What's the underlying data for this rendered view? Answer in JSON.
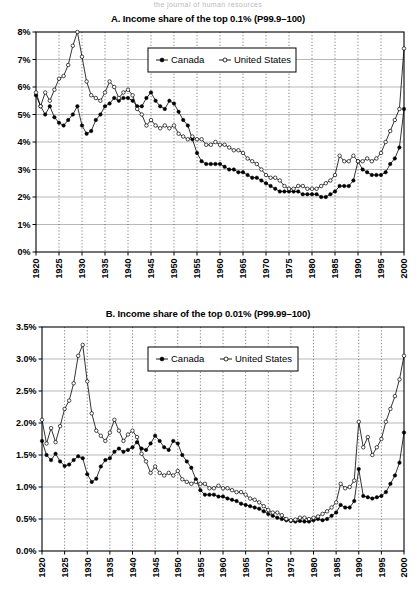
{
  "page": {
    "header_artifact": "the journal of human resources"
  },
  "legend": {
    "series": [
      {
        "name": "Canada",
        "marker": "filled-circle",
        "color": "#000000"
      },
      {
        "name": "United States",
        "marker": "open-circle",
        "color": "#000000"
      }
    ]
  },
  "chart_data": [
    {
      "type": "line",
      "id": "panel-a",
      "title": "A. Income share of the top 0.1% (P99.9–100)",
      "xlabel": "",
      "ylabel": "",
      "xlim": [
        1920,
        2000
      ],
      "ylim": [
        0,
        8
      ],
      "grid": true,
      "legend_position": "upper-center",
      "xticks": [
        1920,
        1925,
        1930,
        1935,
        1940,
        1945,
        1950,
        1955,
        1960,
        1965,
        1970,
        1975,
        1980,
        1985,
        1990,
        1995,
        2000
      ],
      "xticklabels": [
        "1920",
        "1925",
        "1930",
        "1935",
        "1940",
        "1945",
        "1950",
        "1955",
        "1960",
        "1965",
        "1970",
        "1975",
        "1980",
        "1985",
        "1990",
        "1995",
        "2000"
      ],
      "yticks": [
        0,
        1,
        2,
        3,
        4,
        5,
        6,
        7,
        8
      ],
      "yticklabels": [
        "0%",
        "1%",
        "2%",
        "3%",
        "4%",
        "5%",
        "6%",
        "7%",
        "8%"
      ],
      "x": [
        1920,
        1921,
        1922,
        1923,
        1924,
        1925,
        1926,
        1927,
        1928,
        1929,
        1930,
        1931,
        1932,
        1933,
        1934,
        1935,
        1936,
        1937,
        1938,
        1939,
        1940,
        1941,
        1942,
        1943,
        1944,
        1945,
        1946,
        1947,
        1948,
        1949,
        1950,
        1951,
        1952,
        1953,
        1954,
        1955,
        1956,
        1957,
        1958,
        1959,
        1960,
        1961,
        1962,
        1963,
        1964,
        1965,
        1966,
        1967,
        1968,
        1969,
        1970,
        1971,
        1972,
        1973,
        1974,
        1975,
        1976,
        1977,
        1978,
        1979,
        1980,
        1981,
        1982,
        1983,
        1984,
        1985,
        1986,
        1987,
        1988,
        1989,
        1990,
        1991,
        1992,
        1993,
        1994,
        1995,
        1996,
        1997,
        1998,
        1999,
        2000
      ],
      "series": [
        {
          "name": "Canada",
          "marker": "filled-circle",
          "values": [
            5.7,
            5.3,
            5.0,
            5.3,
            4.9,
            4.7,
            4.6,
            4.8,
            5.0,
            5.3,
            4.6,
            4.3,
            4.4,
            4.8,
            5.0,
            5.3,
            5.4,
            5.6,
            5.5,
            5.6,
            5.6,
            5.5,
            5.3,
            5.3,
            5.6,
            5.8,
            5.5,
            5.3,
            5.2,
            5.5,
            5.4,
            5.1,
            4.8,
            4.6,
            4.1,
            3.6,
            3.3,
            3.2,
            3.2,
            3.2,
            3.2,
            3.1,
            3.0,
            3.0,
            2.9,
            2.9,
            2.8,
            2.7,
            2.7,
            2.6,
            2.5,
            2.4,
            2.3,
            2.2,
            2.2,
            2.2,
            2.2,
            2.2,
            2.1,
            2.1,
            2.1,
            2.1,
            2.0,
            2.0,
            2.1,
            2.2,
            2.4,
            2.4,
            2.4,
            2.6,
            3.3,
            3.0,
            2.9,
            2.8,
            2.8,
            2.8,
            2.9,
            3.2,
            3.4,
            3.8,
            5.2
          ]
        },
        {
          "name": "United States",
          "marker": "open-circle",
          "values": [
            5.8,
            5.3,
            5.8,
            5.5,
            5.9,
            6.3,
            6.4,
            6.8,
            7.5,
            8.0,
            7.1,
            6.2,
            5.7,
            5.6,
            5.5,
            5.8,
            6.2,
            6.0,
            5.6,
            5.8,
            5.9,
            5.7,
            5.2,
            5.0,
            4.6,
            4.8,
            4.6,
            4.5,
            4.6,
            4.5,
            4.6,
            4.3,
            4.2,
            4.1,
            4.2,
            4.1,
            4.1,
            3.9,
            3.9,
            4.0,
            3.9,
            3.9,
            3.8,
            3.7,
            3.7,
            3.6,
            3.4,
            3.3,
            3.2,
            3.0,
            2.8,
            2.7,
            2.7,
            2.6,
            2.4,
            2.3,
            2.3,
            2.4,
            2.4,
            2.3,
            2.3,
            2.3,
            2.4,
            2.5,
            2.6,
            2.8,
            3.5,
            3.3,
            3.3,
            3.5,
            3.3,
            3.3,
            3.4,
            3.3,
            3.4,
            3.6,
            4.0,
            4.4,
            4.8,
            5.2,
            7.4
          ]
        }
      ]
    },
    {
      "type": "line",
      "id": "panel-b",
      "title": "B. Income share of the top 0.01% (P99.99–100)",
      "xlabel": "",
      "ylabel": "",
      "xlim": [
        1920,
        2000
      ],
      "ylim": [
        0,
        3.5
      ],
      "grid": true,
      "legend_position": "upper-center",
      "xticks": [
        1920,
        1925,
        1930,
        1935,
        1940,
        1945,
        1950,
        1955,
        1960,
        1965,
        1970,
        1975,
        1980,
        1985,
        1990,
        1995,
        2000
      ],
      "xticklabels": [
        "1920",
        "1925",
        "1930",
        "1935",
        "1940",
        "1945",
        "1950",
        "1955",
        "1960",
        "1965",
        "1970",
        "1975",
        "1980",
        "1985",
        "1990",
        "1995",
        "2000"
      ],
      "yticks": [
        0.0,
        0.5,
        1.0,
        1.5,
        2.0,
        2.5,
        3.0,
        3.5
      ],
      "yticklabels": [
        "0.0%",
        "0.5%",
        "1.0%",
        "1.5%",
        "2.0%",
        "2.5%",
        "3.0%",
        "3.5%"
      ],
      "x": [
        1920,
        1921,
        1922,
        1923,
        1924,
        1925,
        1926,
        1927,
        1928,
        1929,
        1930,
        1931,
        1932,
        1933,
        1934,
        1935,
        1936,
        1937,
        1938,
        1939,
        1940,
        1941,
        1942,
        1943,
        1944,
        1945,
        1946,
        1947,
        1948,
        1949,
        1950,
        1951,
        1952,
        1953,
        1954,
        1955,
        1956,
        1957,
        1958,
        1959,
        1960,
        1961,
        1962,
        1963,
        1964,
        1965,
        1966,
        1967,
        1968,
        1969,
        1970,
        1971,
        1972,
        1973,
        1974,
        1975,
        1976,
        1977,
        1978,
        1979,
        1980,
        1981,
        1982,
        1983,
        1984,
        1985,
        1986,
        1987,
        1988,
        1989,
        1990,
        1991,
        1992,
        1993,
        1994,
        1995,
        1996,
        1997,
        1998,
        1999,
        2000
      ],
      "series": [
        {
          "name": "Canada",
          "marker": "filled-circle",
          "values": [
            1.72,
            1.5,
            1.42,
            1.52,
            1.4,
            1.33,
            1.35,
            1.42,
            1.48,
            1.45,
            1.2,
            1.08,
            1.13,
            1.32,
            1.42,
            1.45,
            1.55,
            1.6,
            1.55,
            1.58,
            1.62,
            1.7,
            1.6,
            1.58,
            1.68,
            1.8,
            1.72,
            1.62,
            1.58,
            1.72,
            1.68,
            1.5,
            1.4,
            1.3,
            1.12,
            0.95,
            0.88,
            0.88,
            0.88,
            0.85,
            0.85,
            0.82,
            0.8,
            0.78,
            0.74,
            0.72,
            0.7,
            0.68,
            0.66,
            0.62,
            0.58,
            0.55,
            0.52,
            0.5,
            0.48,
            0.47,
            0.46,
            0.47,
            0.46,
            0.46,
            0.48,
            0.5,
            0.48,
            0.5,
            0.55,
            0.6,
            0.72,
            0.68,
            0.68,
            0.78,
            1.28,
            0.86,
            0.84,
            0.82,
            0.84,
            0.86,
            0.92,
            1.05,
            1.18,
            1.38,
            1.85
          ]
        },
        {
          "name": "United States",
          "marker": "open-circle",
          "values": [
            2.05,
            1.68,
            1.92,
            1.7,
            1.95,
            2.22,
            2.35,
            2.62,
            3.05,
            3.22,
            2.65,
            2.15,
            1.88,
            1.8,
            1.72,
            1.85,
            2.05,
            1.88,
            1.72,
            1.82,
            1.88,
            1.78,
            1.52,
            1.4,
            1.22,
            1.32,
            1.22,
            1.18,
            1.22,
            1.18,
            1.25,
            1.12,
            1.08,
            1.05,
            1.08,
            1.05,
            1.05,
            0.98,
            0.98,
            1.02,
            0.98,
            0.98,
            0.95,
            0.92,
            0.92,
            0.88,
            0.82,
            0.8,
            0.76,
            0.7,
            0.64,
            0.6,
            0.6,
            0.56,
            0.5,
            0.48,
            0.49,
            0.52,
            0.52,
            0.5,
            0.52,
            0.54,
            0.58,
            0.62,
            0.68,
            0.76,
            1.05,
            0.98,
            1.0,
            1.1,
            2.02,
            1.62,
            1.78,
            1.5,
            1.62,
            1.75,
            2.02,
            2.22,
            2.42,
            2.68,
            3.05
          ]
        }
      ]
    }
  ]
}
